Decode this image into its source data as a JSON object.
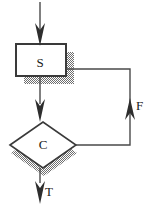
{
  "diagram": {
    "type": "flowchart",
    "background_color": "#ffffff",
    "line_color": "#3a3a3a",
    "shadow_color": "#8c8c8c",
    "text_color": "#1a1a1a",
    "nodes": [
      {
        "id": "statement",
        "shape": "rectangle",
        "label": "S",
        "x": 16,
        "y": 44,
        "width": 50,
        "height": 32,
        "has_shadow": true
      },
      {
        "id": "condition",
        "shape": "diamond",
        "label": "C",
        "cx": 43,
        "cy": 145,
        "rx": 33,
        "ry": 23,
        "has_shadow": true
      }
    ],
    "edges": [
      {
        "id": "entry",
        "from": "start",
        "to": "statement",
        "label": "",
        "arrowhead": "down"
      },
      {
        "id": "statement-to-condition",
        "from": "statement",
        "to": "condition",
        "label": "",
        "arrowhead": "down"
      },
      {
        "id": "condition-false-loopback",
        "from": "condition",
        "to": "statement",
        "label": "F",
        "arrowhead": "up"
      },
      {
        "id": "condition-true-exit",
        "from": "condition",
        "to": "end",
        "label": "T",
        "arrowhead": "down"
      }
    ],
    "labels": {
      "statement": "S",
      "condition": "C",
      "false_branch": "F",
      "true_branch": "T"
    }
  }
}
